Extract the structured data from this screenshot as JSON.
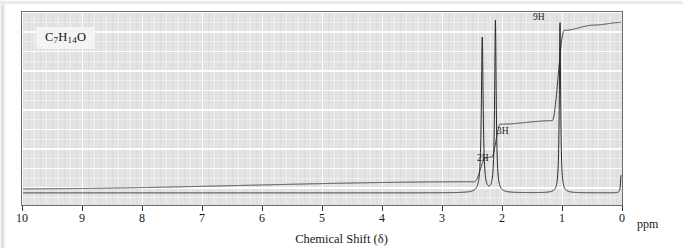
{
  "figure": {
    "kind": "nmr-spectrum",
    "formula": "C7H14O",
    "formula_parts": {
      "c": "C",
      "c_n": "7",
      "h": "H",
      "h_n": "14",
      "o": "O"
    },
    "background_color": "#e3e3e3",
    "frame_color": "#6d6d6d",
    "trace_color": "#2b2b2b",
    "integral_color": "#3a3a3a"
  },
  "axis": {
    "title": "Chemical Shift (δ)",
    "unit_label": "ppm",
    "ticks": [
      10,
      9,
      8,
      7,
      6,
      5,
      4,
      3,
      2,
      1,
      0
    ],
    "tick_labels": [
      "10",
      "9",
      "8",
      "7",
      "6",
      "5",
      "4",
      "3",
      "2",
      "1",
      "0"
    ],
    "direction": "descending",
    "min": 0,
    "max": 10
  },
  "annotations": [
    {
      "name": "integration-label-9h",
      "text": "9H",
      "ppm": 1.05
    },
    {
      "name": "integration-label-3h",
      "text": "3H",
      "ppm": 2.08
    },
    {
      "name": "integration-label-2h",
      "text": "2H",
      "ppm": 2.38
    }
  ],
  "chart_data": {
    "type": "line",
    "title": "",
    "xlabel": "Chemical Shift (δ)",
    "ylabel": "",
    "xlim": [
      10,
      0
    ],
    "ylim": [
      0,
      1
    ],
    "grid": true,
    "legend": null,
    "series": [
      {
        "name": "spectrum",
        "peaks": [
          {
            "ppm": 2.32,
            "height": 0.88,
            "width": 0.035,
            "protons": 2,
            "assignment": "2H"
          },
          {
            "ppm": 2.1,
            "height": 0.97,
            "width": 0.03,
            "protons": 3,
            "assignment": "3H"
          },
          {
            "ppm": 1.02,
            "height": 0.97,
            "width": 0.026,
            "protons": 9,
            "assignment": "9H"
          },
          {
            "ppm": 0.0,
            "height": 0.1,
            "width": 0.02,
            "protons": 0,
            "assignment": "TMS"
          }
        ]
      },
      {
        "name": "integration-trace",
        "steps": [
          {
            "ppm": 10.0,
            "level": 0.035
          },
          {
            "ppm": 2.45,
            "level": 0.075
          },
          {
            "ppm": 2.26,
            "level": 0.21
          },
          {
            "ppm": 2.16,
            "level": 0.215
          },
          {
            "ppm": 2.02,
            "level": 0.4
          },
          {
            "ppm": 1.15,
            "level": 0.42
          },
          {
            "ppm": 0.95,
            "level": 0.93
          },
          {
            "ppm": 0.45,
            "level": 0.96
          },
          {
            "ppm": 0.0,
            "level": 0.975
          }
        ]
      }
    ]
  }
}
